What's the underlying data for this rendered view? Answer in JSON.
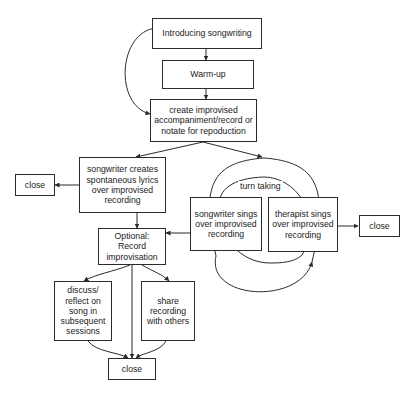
{
  "diagram": {
    "stroke_color": "#2b2b2b",
    "text_color": "#1a1a1a",
    "background_color": "#ffffff",
    "nodes": [
      {
        "id": "introducing",
        "label": "Introducing songwriting"
      },
      {
        "id": "warmup",
        "label": "Warm-up"
      },
      {
        "id": "create",
        "label": "create improvised accompaniment/record or notate for repoduction"
      },
      {
        "id": "songwriter_creates",
        "label": "songwriter creates spontaneous lyrics over improvised recording"
      },
      {
        "id": "close_left",
        "label": "close"
      },
      {
        "id": "optional_record",
        "label": "Optional: Record improvisation"
      },
      {
        "id": "songwriter_sings",
        "label": "songwriter sings over improvised recording"
      },
      {
        "id": "therapist_sings",
        "label": "therapist sings over improvised recording"
      },
      {
        "id": "close_right",
        "label": "close"
      },
      {
        "id": "discuss_reflect",
        "label": "discuss/ reflect on song in subsequent sessions"
      },
      {
        "id": "share_recording",
        "label": "share recording with others"
      },
      {
        "id": "close_bottom",
        "label": "close"
      }
    ],
    "cycle_label": "turn taking",
    "edges": [
      {
        "from": "introducing",
        "to": "warmup"
      },
      {
        "from": "warmup",
        "to": "create"
      },
      {
        "from": "introducing",
        "to": "create",
        "style": "curved-loop-left"
      },
      {
        "from": "create",
        "to": "songwriter_creates"
      },
      {
        "from": "create",
        "to": "songwriter_sings"
      },
      {
        "from": "songwriter_creates",
        "to": "close_left"
      },
      {
        "from": "songwriter_creates",
        "to": "optional_record"
      },
      {
        "from": "songwriter_sings",
        "to": "optional_record"
      },
      {
        "from": "songwriter_sings",
        "to": "therapist_sings",
        "style": "arc-outer"
      },
      {
        "from": "therapist_sings",
        "to": "songwriter_sings",
        "style": "arc-inner"
      },
      {
        "from": "therapist_sings",
        "to": "close_right"
      },
      {
        "from": "optional_record",
        "to": "discuss_reflect"
      },
      {
        "from": "optional_record",
        "to": "share_recording"
      },
      {
        "from": "optional_record",
        "to": "close_bottom"
      },
      {
        "from": "discuss_reflect",
        "to": "close_bottom"
      },
      {
        "from": "share_recording",
        "to": "close_bottom"
      }
    ]
  }
}
